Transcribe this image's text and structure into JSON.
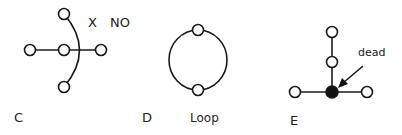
{
  "panels": {
    "c": {
      "letter": "C",
      "mark": "X",
      "note": "NO"
    },
    "d": {
      "letter": "D",
      "caption": "Loop"
    },
    "e": {
      "letter": "E",
      "annotation": "dead"
    }
  },
  "colors": {
    "stroke": "#1a1a1a",
    "node_fill": "#ffffff",
    "dead_fill": "#111111"
  }
}
